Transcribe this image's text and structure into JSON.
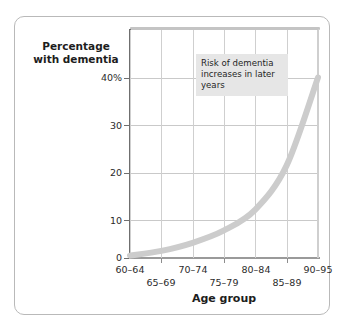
{
  "chart_data": {
    "type": "line",
    "title": "",
    "xlabel": "Age group",
    "ylabel": "Percentage with dementia",
    "categories": [
      "60–64",
      "65–69",
      "70–74",
      "75–79",
      "80–84",
      "85–89",
      "90–95"
    ],
    "values": [
      0.5,
      1.5,
      3.2,
      5.8,
      10.2,
      19.5,
      38.0
    ],
    "series": [
      {
        "name": "Percentage with dementia",
        "values": [
          0.5,
          1.5,
          3.2,
          5.8,
          10.2,
          19.5,
          38.0
        ]
      }
    ],
    "ylim": [
      0,
      48
    ],
    "xlim": [
      0,
      6
    ],
    "y_ticks": [
      0,
      10,
      20,
      30,
      40
    ],
    "y_tick_labels": [
      "0",
      "10",
      "20",
      "30",
      "40%"
    ],
    "grid": true,
    "legend": false,
    "legend_position": "none",
    "series_color": "#cccccc",
    "gridline_color": "#c9c9c9",
    "axis_color": "#6f6f6f",
    "annotations": [
      {
        "text": "Risk of dementia increases in later years",
        "background": "#e6e6e6"
      }
    ]
  },
  "axes": {
    "y_title_line1": "Percentage",
    "y_title_line2": "with dementia",
    "x_title": "Age group",
    "y_tick_labels": [
      "40%",
      "30",
      "20",
      "10",
      "0"
    ],
    "x_tick_labels_row1": [
      "60–64",
      "70–74",
      "80–84",
      "90–95"
    ],
    "x_tick_labels_row2": [
      "65–69",
      "75–79",
      "85–89"
    ]
  },
  "annotation": {
    "text": "Risk of dementia increases in later years"
  }
}
